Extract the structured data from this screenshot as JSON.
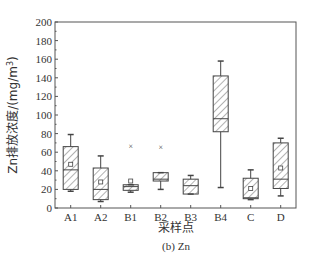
{
  "chart_data": {
    "type": "box",
    "title": "",
    "caption": "(b) Zn",
    "xlabel": "采样点",
    "ylabel": "Zn排放浓度/(mg/m³)",
    "ylabel_prefix": "Zn排放浓度/(mg/m",
    "ylabel_sup": "3",
    "ylabel_suffix": ")",
    "ylim": [
      0,
      200
    ],
    "yticks": [
      0,
      20,
      40,
      60,
      80,
      100,
      120,
      140,
      160,
      180,
      200
    ],
    "grid": false,
    "legend": null,
    "categories": [
      "A1",
      "A2",
      "B1",
      "B2",
      "B3",
      "B4",
      "C",
      "D"
    ],
    "boxes": [
      {
        "label": "A1",
        "whisker_low": 18,
        "q1": 20,
        "median": 41,
        "q3": 66,
        "whisker_high": 79,
        "mean": 47,
        "outliers": []
      },
      {
        "label": "A2",
        "whisker_low": 7,
        "q1": 9,
        "median": 20,
        "q3": 43,
        "whisker_high": 56,
        "mean": 28,
        "outliers": []
      },
      {
        "label": "B1",
        "whisker_low": 17,
        "q1": 19,
        "median": 23,
        "q3": 25,
        "whisker_high": 25,
        "mean": 29,
        "outliers": [
          67
        ]
      },
      {
        "label": "B2",
        "whisker_low": 20,
        "q1": 29,
        "median": 31,
        "q3": 38,
        "whisker_high": 38,
        "mean": null,
        "outliers": [
          66
        ]
      },
      {
        "label": "B3",
        "whisker_low": 15,
        "q1": 15,
        "median": 24,
        "q3": 31,
        "whisker_high": 35,
        "mean": null,
        "outliers": []
      },
      {
        "label": "B4",
        "whisker_low": 22,
        "q1": 82,
        "median": 96,
        "q3": 142,
        "whisker_high": 158,
        "mean": null,
        "outliers": []
      },
      {
        "label": "C",
        "whisker_low": 9,
        "q1": 10,
        "median": 11,
        "q3": 32,
        "whisker_high": 41,
        "mean": 21,
        "outliers": []
      },
      {
        "label": "D",
        "whisker_low": 13,
        "q1": 21,
        "median": 31,
        "q3": 70,
        "whisker_high": 75,
        "mean": 43,
        "outliers": []
      }
    ]
  },
  "colors": {
    "axis": "#555555",
    "box_stroke": "#444444",
    "hatch": "#666666",
    "text": "#333333"
  }
}
